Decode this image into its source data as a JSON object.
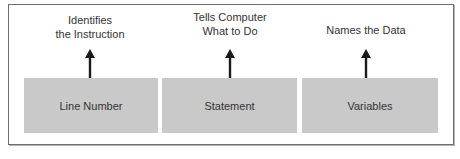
{
  "diagram": {
    "type": "statement-structure",
    "columns": [
      {
        "box_label": "Line Number",
        "annotation_line1": "Identifies",
        "annotation_line2": "the Instruction"
      },
      {
        "box_label": "Statement",
        "annotation_line1": "Tells Computer",
        "annotation_line2": "What to Do"
      },
      {
        "box_label": "Variables",
        "annotation_line1": "",
        "annotation_line2": "Names the Data"
      }
    ],
    "colors": {
      "box_fill": "#c9c9c9",
      "arrow": "#1a1a1a",
      "frame_border": "#6e6e6e"
    }
  }
}
